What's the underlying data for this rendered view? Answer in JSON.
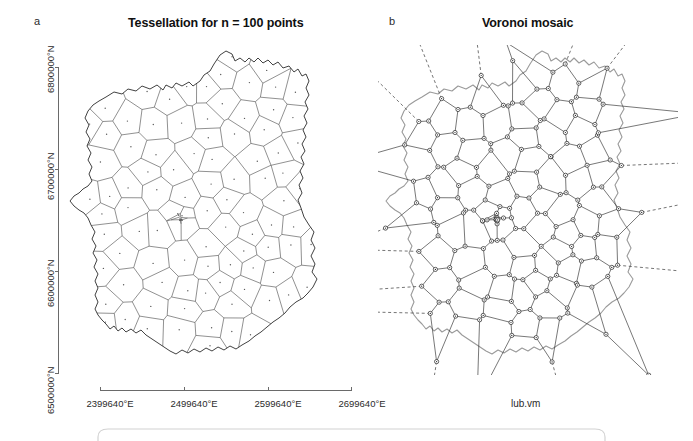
{
  "figure": {
    "panels": [
      {
        "label": "a",
        "title": "Tessellation for n = 100 points",
        "type": "voronoi-tessellation-map",
        "n_points": 100,
        "axes": {
          "y_ticks": [
            "6500000°N",
            "6600000°N",
            "6700000°N",
            "6800000°N"
          ],
          "x_ticks": [
            "2399640°E",
            "2499640°E",
            "2599640°E",
            "2699640°E"
          ]
        }
      },
      {
        "label": "b",
        "title": "Voronoi mosaic",
        "type": "voronoi-mosaic-graph",
        "caption": "lub.vm"
      }
    ]
  },
  "colors": {
    "background": "#ffffff",
    "ink": "#1a1a1a",
    "tessellation_line": "#4a4a4a",
    "boundary_line": "#2b2b2b",
    "region_outline_gray": "#9a9a9a",
    "axis": "#6a6a6a",
    "frame": "#c9c9c9"
  },
  "chart_data": {
    "type": "scatter",
    "title": "Tessellation for n = 100 points",
    "subtitle": "Voronoi mosaic",
    "xlabel": "",
    "ylabel": "",
    "xlim": [
      2349640,
      2749640
    ],
    "ylim": [
      6450000,
      6850000
    ],
    "x_tick_values": [
      2399640,
      2499640,
      2599640,
      2699640
    ],
    "y_tick_values": [
      6500000,
      6600000,
      6700000,
      6800000
    ],
    "x_tick_labels": [
      "2399640°E",
      "2499640°E",
      "2599640°E",
      "2699640°E"
    ],
    "y_tick_labels": [
      "6500000°N",
      "6600000°N",
      "6700000°N",
      "6800000°N"
    ],
    "grid": false,
    "legend": null,
    "n_generators": 100,
    "region_name": "Lubelskie",
    "series": [
      {
        "name": "generator points",
        "n": 100,
        "marker": "dot"
      },
      {
        "name": "voronoi cell edges",
        "style": "solid thin"
      },
      {
        "name": "region boundary",
        "style": "solid"
      },
      {
        "name": "mosaic graph nodes",
        "marker": "open circle"
      },
      {
        "name": "mosaic unbounded rays",
        "style": "dashed"
      }
    ]
  }
}
